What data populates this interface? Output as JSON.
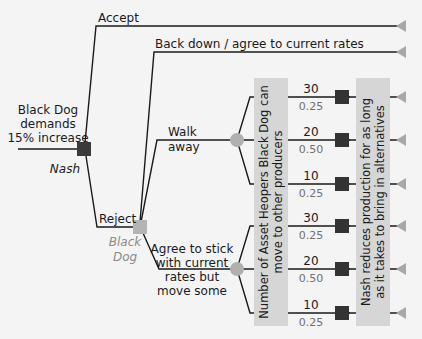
{
  "colors": {
    "background": "#f4f4f4",
    "line": "#1a1a1a",
    "decision_node": "#3a3a3a",
    "black_dog_node": "#b4b4b4",
    "chance_node": "#b0b0b0",
    "outcome_node": "#333333",
    "terminal": "#a8a8a8",
    "band": "#d6d6d6",
    "probability_text": "#707070",
    "black_dog_label": "#8a8a8a"
  },
  "root": {
    "label_lines": [
      "Black Dog",
      "demands",
      "15% increase"
    ],
    "decision_maker": "Nash"
  },
  "nash_branches": {
    "accept": "Accept",
    "reject": "Reject"
  },
  "black_dog_node": {
    "label_lines": [
      "Black",
      "Dog"
    ],
    "branches": {
      "back_down": "Back down / agree to current rates",
      "walk_away_lines": [
        "Walk",
        "away"
      ],
      "agree_lines": [
        "Agree to stick",
        "with current",
        "rates but",
        "move some"
      ]
    }
  },
  "bands": {
    "left_lines": [
      "Number of Asset Heopers Black Dog can",
      "move to other producers"
    ],
    "right_lines": [
      "Nash reduces production for as long",
      "as it takes to bring in alternatives"
    ]
  },
  "walk_away_outcomes": [
    {
      "value": "30",
      "probability": "0.25"
    },
    {
      "value": "20",
      "probability": "0.50"
    },
    {
      "value": "10",
      "probability": "0.25"
    }
  ],
  "agree_outcomes": [
    {
      "value": "30",
      "probability": "0.25"
    },
    {
      "value": "20",
      "probability": "0.50"
    },
    {
      "value": "10",
      "probability": "0.25"
    }
  ]
}
